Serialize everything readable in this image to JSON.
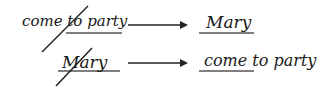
{
  "rows": [
    {
      "left_text": "come to party",
      "left_crossed": "come to",
      "left_underlined": "party",
      "arrow": "→",
      "right_text": "Mary",
      "right_underlined": "Mary"
    },
    {
      "left_text": "Mary",
      "left_crossed": "Mary",
      "left_underlined": "Mary",
      "arrow": "→",
      "right_text": "come to party",
      "right_underlined": "come"
    }
  ],
  "colors": {
    "ink": "#1a1a1a",
    "underline": "#555555"
  }
}
